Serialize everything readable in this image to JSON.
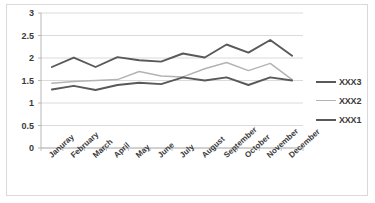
{
  "chart_data": {
    "type": "line",
    "title": "",
    "xlabel": "",
    "ylabel": "",
    "ylim": [
      0,
      3
    ],
    "yticks": [
      "0",
      "0.5",
      "1",
      "1.5",
      "2",
      "2.5",
      "3"
    ],
    "ytick_values": [
      0,
      0.5,
      1,
      1.5,
      2,
      2.5,
      3
    ],
    "grid": true,
    "legend_position": "right",
    "categories": [
      "Januray",
      "February",
      "March",
      "April",
      "May",
      "June",
      "July",
      "August",
      "September",
      "October",
      "November",
      "December"
    ],
    "series": [
      {
        "name": "XXX3",
        "color": "#595959",
        "width": 1.9,
        "values": [
          1.8,
          2.01,
          1.8,
          2.02,
          1.95,
          1.92,
          2.1,
          2.01,
          2.3,
          2.12,
          2.4,
          2.05
        ]
      },
      {
        "name": "XXX2",
        "color": "#b3b3b3",
        "width": 1.5,
        "values": [
          1.44,
          1.48,
          1.5,
          1.52,
          1.7,
          1.6,
          1.58,
          1.76,
          1.9,
          1.72,
          1.88,
          1.52
        ]
      },
      {
        "name": "XXX1",
        "color": "#595959",
        "width": 1.9,
        "values": [
          1.3,
          1.38,
          1.29,
          1.4,
          1.45,
          1.42,
          1.57,
          1.5,
          1.57,
          1.4,
          1.57,
          1.5
        ]
      }
    ]
  },
  "legend": {
    "entries": [
      {
        "label": "XXX3",
        "color": "#595959",
        "width": "2px"
      },
      {
        "label": "XXX2",
        "color": "#b3b3b3",
        "width": "1.5px"
      },
      {
        "label": "XXX1",
        "color": "#595959",
        "width": "2px"
      }
    ]
  },
  "colors": {
    "grid": "#d0d0d0",
    "axis": "#b0b0b0",
    "frame": "#d9d9d9",
    "text": "#3a3a3a",
    "series_dark": "#595959",
    "series_light": "#b3b3b3"
  }
}
